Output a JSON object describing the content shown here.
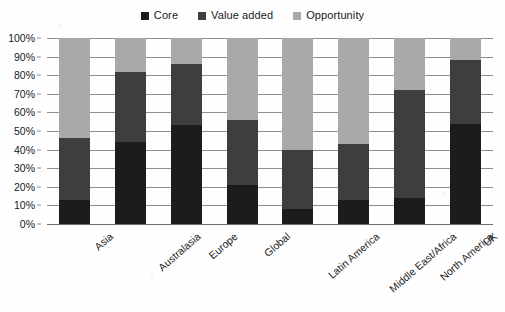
{
  "chart_data": {
    "type": "bar",
    "stacked": true,
    "title": "",
    "subtitle": "",
    "xlabel": "",
    "ylabel": "",
    "ylim": [
      0,
      100
    ],
    "grid": true,
    "legend_position": "top-center",
    "categories": [
      "Asia",
      "Australasia",
      "Europe",
      "Global",
      "Latin America",
      "Middle East/Africa",
      "North America",
      "UK"
    ],
    "y_ticks": [
      "0%",
      "10%",
      "20%",
      "30%",
      "40%",
      "50%",
      "60%",
      "70%",
      "80%",
      "90%",
      "100%"
    ],
    "y_tick_values": [
      0,
      10,
      20,
      30,
      40,
      50,
      60,
      70,
      80,
      90,
      100
    ],
    "series": [
      {
        "name": "Core",
        "color": "#1c1c1c",
        "values": [
          13,
          44,
          53,
          21,
          8,
          13,
          14,
          54
        ]
      },
      {
        "name": "Value added",
        "color": "#3e3e3e",
        "values": [
          33,
          38,
          33,
          35,
          32,
          30,
          58,
          34
        ]
      },
      {
        "name": "Opportunity",
        "color": "#a9a9a9",
        "values": [
          54,
          18,
          14,
          44,
          60,
          57,
          28,
          12
        ]
      }
    ],
    "cumulative_tops": {
      "Asia": [
        13,
        46,
        100
      ],
      "Australasia": [
        44,
        82,
        100
      ],
      "Europe": [
        53,
        86,
        100
      ],
      "Global": [
        21,
        56,
        100
      ],
      "Latin America": [
        8,
        40,
        100
      ],
      "Middle East/Africa": [
        13,
        43,
        100
      ],
      "North America": [
        14,
        72,
        100
      ],
      "UK": [
        54,
        88,
        100
      ]
    }
  },
  "colors": {
    "core": "#1c1c1c",
    "value_added": "#3e3e3e",
    "opportunity": "#a9a9a9",
    "gridline": "#8d8d8d",
    "background": "#fefefe"
  }
}
